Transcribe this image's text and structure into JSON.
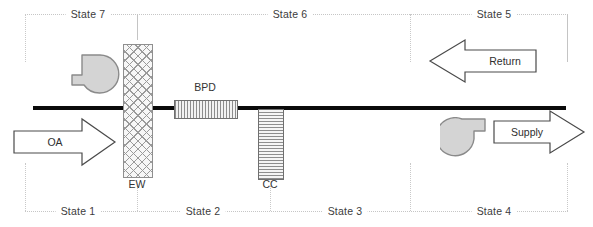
{
  "diagram": {
    "canvas": {
      "width": 593,
      "height": 227
    },
    "colors": {
      "duct": "#0a0a0a",
      "boundary": "#c6c6c6",
      "fan_fill": "#d4d4d4",
      "fan_stroke": "#8a8a8a",
      "arrow_stroke": "#4a4a4a",
      "text": "#333333"
    }
  },
  "states_top": [
    {
      "id": "state-7",
      "label": "State 7",
      "x": 88,
      "y": 14
    },
    {
      "id": "state-6",
      "label": "State 6",
      "x": 290,
      "y": 14
    },
    {
      "id": "state-5",
      "label": "State 5",
      "x": 494,
      "y": 14
    }
  ],
  "states_bottom": [
    {
      "id": "state-1",
      "label": "State 1",
      "x": 78,
      "y": 211
    },
    {
      "id": "state-2",
      "label": "State 2",
      "x": 203,
      "y": 211
    },
    {
      "id": "state-3",
      "label": "State 3",
      "x": 345,
      "y": 211
    },
    {
      "id": "state-4",
      "label": "State 4",
      "x": 494,
      "y": 211
    }
  ],
  "components": [
    {
      "id": "ew",
      "label": "EW",
      "name": "energy-wheel",
      "label_x": 137,
      "label_y": 183
    },
    {
      "id": "bpd",
      "label": "BPD",
      "name": "bypass-damper",
      "label_x": 204,
      "label_y": 86
    },
    {
      "id": "cc",
      "label": "CC",
      "name": "cooling-coil",
      "label_x": 270,
      "label_y": 183
    }
  ],
  "fans": [
    {
      "id": "return-fan",
      "label": "",
      "name": "return-fan"
    },
    {
      "id": "supply-fan",
      "label": "",
      "name": "supply-fan"
    }
  ],
  "arrows": [
    {
      "id": "oa",
      "label": "OA",
      "direction": "right",
      "text_x": 55,
      "text_y": 141
    },
    {
      "id": "return",
      "label": "Return",
      "direction": "left",
      "text_x": 505,
      "text_y": 61
    },
    {
      "id": "supply",
      "label": "Supply",
      "direction": "right",
      "text_x": 528,
      "text_y": 131
    }
  ]
}
